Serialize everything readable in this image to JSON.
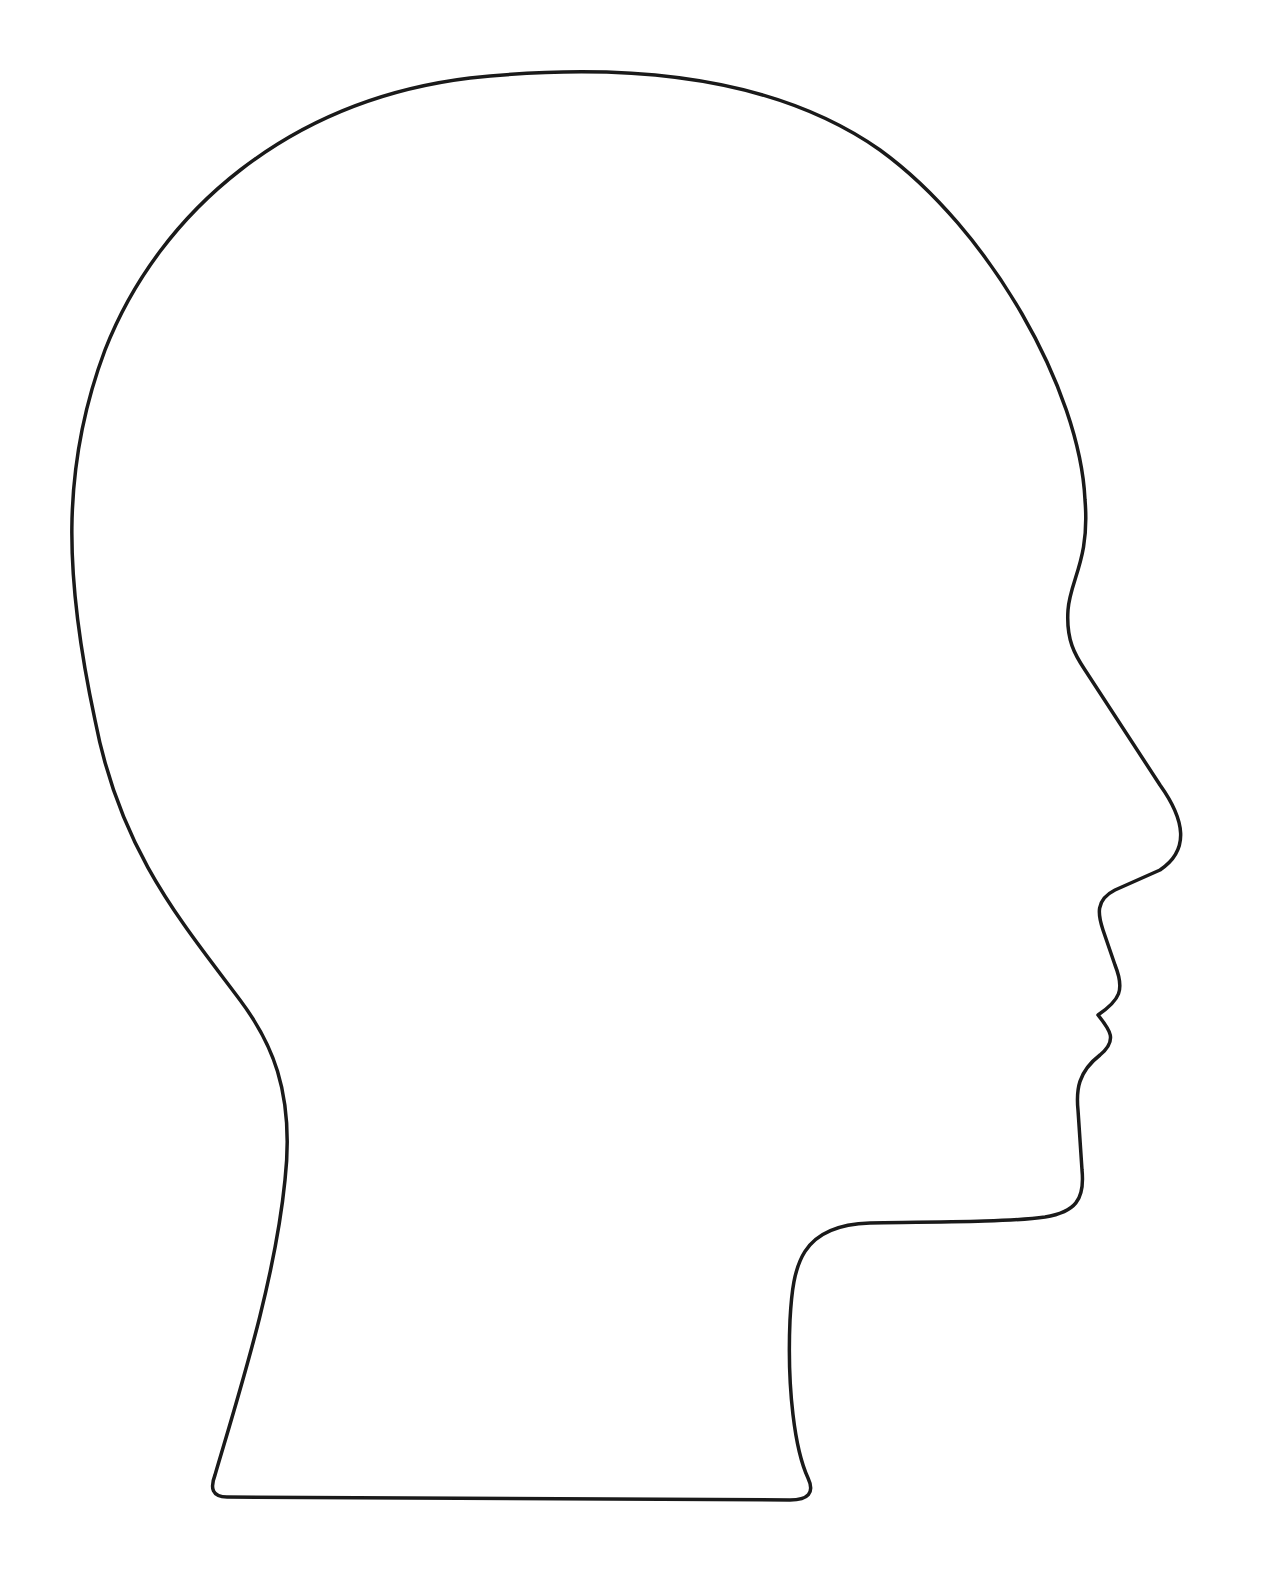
{
  "image": {
    "subject": "Head profile outline",
    "description": "Blank side-view silhouette outline of a human head and neck facing right",
    "stroke_color": "#1a1a1a",
    "background_color": "#ffffff",
    "stroke_width": 3.5
  },
  "caption": {
    "text": ""
  }
}
